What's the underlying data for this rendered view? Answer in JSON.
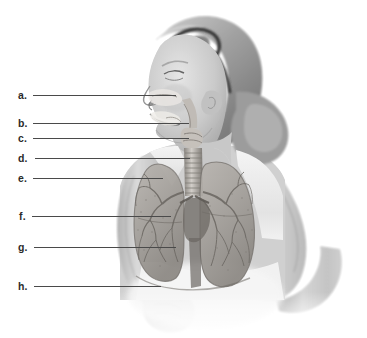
{
  "figure": {
    "background_color": "#ffffff",
    "width": 367,
    "height": 338
  },
  "photo": {
    "subject": "woman-in-profile",
    "is_grayscale": true,
    "elements": [
      {
        "name": "hair",
        "description": "light blonde hair swept back into a low ponytail"
      },
      {
        "name": "sunglasses",
        "description": "dark sunglasses worn pushed up on top of the head"
      },
      {
        "name": "face-profile",
        "description": "face in left-facing profile, smiling"
      },
      {
        "name": "tank-top",
        "description": "white sleeveless athletic top"
      },
      {
        "name": "left-arm",
        "description": "near arm bent at elbow with closed fist"
      },
      {
        "name": "right-arm",
        "description": "far arm bent at elbow behind the torso"
      }
    ]
  },
  "anatomy_overlay": {
    "system": "respiratory-system",
    "structures": [
      {
        "id": "nasal-cavity",
        "name": "nasal cavity"
      },
      {
        "id": "oral-cavity",
        "name": "oral cavity"
      },
      {
        "id": "pharynx",
        "name": "pharynx"
      },
      {
        "id": "larynx",
        "name": "larynx"
      },
      {
        "id": "trachea",
        "name": "trachea"
      },
      {
        "id": "primary-bronchus",
        "name": "primary bronchus"
      },
      {
        "id": "bronchial-tree",
        "name": "bronchial tree"
      },
      {
        "id": "right-lung",
        "name": "right lung"
      },
      {
        "id": "left-lung",
        "name": "left lung"
      },
      {
        "id": "diaphragm",
        "name": "diaphragm"
      }
    ]
  },
  "callouts": [
    {
      "id": "a",
      "letter": "a.",
      "label_x": 18,
      "label_y": 88,
      "line_x1": 33,
      "line_x2": 176,
      "line_y": 95
    },
    {
      "id": "b",
      "letter": "b.",
      "label_x": 18,
      "label_y": 116,
      "line_x1": 33,
      "line_x2": 189,
      "line_y": 123
    },
    {
      "id": "c",
      "letter": "c.",
      "label_x": 18,
      "label_y": 131,
      "line_x1": 33,
      "line_x2": 189,
      "line_y": 138
    },
    {
      "id": "d",
      "letter": "d.",
      "label_x": 18,
      "label_y": 151,
      "line_x1": 35,
      "line_x2": 190,
      "line_y": 158
    },
    {
      "id": "e",
      "letter": "e.",
      "label_x": 18,
      "label_y": 171,
      "line_x1": 33,
      "line_x2": 163,
      "line_y": 178
    },
    {
      "id": "f",
      "letter": "f.",
      "label_x": 19,
      "label_y": 209,
      "line_x1": 32,
      "line_x2": 171,
      "line_y": 216
    },
    {
      "id": "g",
      "letter": "g.",
      "label_x": 18,
      "label_y": 240,
      "line_x1": 34,
      "line_x2": 176,
      "line_y": 247
    },
    {
      "id": "h",
      "letter": "h.",
      "label_x": 18,
      "label_y": 279,
      "line_x1": 34,
      "line_x2": 161,
      "line_y": 286
    }
  ],
  "colors": {
    "background": "#ffffff",
    "leader_line": "#4a4a4a",
    "label_text": "#2b2b2b",
    "lung_tissue": "#9a9a9a",
    "bronchi": "#6f6f6f",
    "skin_midtone": "#c9c3bd"
  }
}
